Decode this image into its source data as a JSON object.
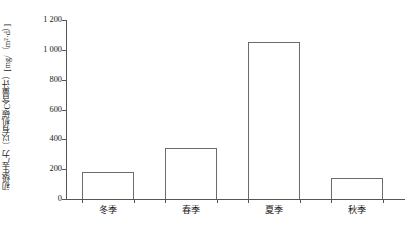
{
  "chart_data": {
    "type": "bar",
    "title": "",
    "xlabel": "",
    "ylabel": "初级生产力（以有机碳C含量计）[mg/（m²·d）]",
    "categories": [
      "冬季",
      "春季",
      "夏季",
      "秋季"
    ],
    "values": [
      180,
      340,
      1050,
      140
    ],
    "ylim": [
      0,
      1200
    ],
    "y_ticks": [
      0,
      200,
      400,
      600,
      800,
      1000,
      1200
    ],
    "y_tick_labels": [
      "0",
      "200",
      "400",
      "600",
      "800",
      "1 000",
      "1 200"
    ],
    "grid": false,
    "legend": null,
    "series": [
      {
        "name": "初级生产力",
        "values": [
          180,
          340,
          1050,
          140
        ]
      }
    ],
    "annotations": [],
    "colors": {
      "bar_fill": "#ffffff",
      "bar_stroke": "#6b6b6b",
      "axis": "#555555",
      "text": "#1a1a1a",
      "background": "#ffffff"
    }
  }
}
